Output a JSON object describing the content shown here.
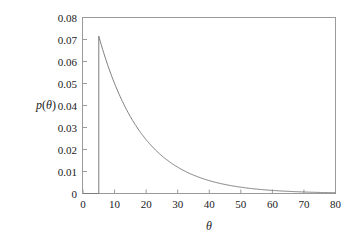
{
  "chart_data": {
    "type": "line",
    "title": "",
    "subtitle": "",
    "xlabel": "θ",
    "ylabel": "p(θ)",
    "xlim": [
      0,
      80
    ],
    "ylim": [
      0,
      0.08
    ],
    "grid": false,
    "legend": null,
    "x_ticks": [
      0,
      10,
      20,
      30,
      40,
      50,
      60,
      70,
      80
    ],
    "x_tick_labels": [
      "0",
      "10",
      "20",
      "30",
      "40",
      "50",
      "60",
      "70",
      "80"
    ],
    "x_minor_ticks": [
      5,
      15,
      25,
      35,
      45,
      55,
      65,
      75
    ],
    "y_ticks": [
      0,
      0.01,
      0.02,
      0.03,
      0.04,
      0.05,
      0.06,
      0.07,
      0.08
    ],
    "y_tick_labels": [
      "0",
      "0.01",
      "0.02",
      "0.03",
      "0.04",
      "0.05",
      "0.06",
      "0.07",
      "0.08"
    ],
    "threshold": 5,
    "peak_value": 0.0715,
    "decay_rate": 0.0715,
    "series": [
      {
        "name": "p(theta)",
        "color": "#7d7d7d",
        "x": [
          0,
          1,
          2,
          3,
          4,
          5,
          5,
          6,
          7,
          8,
          9,
          10,
          11,
          12,
          13,
          14,
          15,
          16,
          17,
          18,
          19,
          20,
          22,
          24,
          26,
          28,
          30,
          32,
          34,
          36,
          38,
          40,
          42,
          44,
          46,
          48,
          50,
          52,
          54,
          56,
          58,
          60,
          62,
          64,
          66,
          68,
          70,
          72,
          74,
          76,
          78,
          80
        ],
        "y": [
          0,
          0,
          0,
          0,
          0,
          0,
          0.0715,
          0.0666,
          0.062,
          0.0577,
          0.0538,
          0.0501,
          0.0466,
          0.0434,
          0.0404,
          0.0376,
          0.035,
          0.0326,
          0.0304,
          0.0283,
          0.0263,
          0.0245,
          0.0213,
          0.0184,
          0.016,
          0.0139,
          0.012,
          0.0104,
          0.0091,
          0.0079,
          0.0068,
          0.0059,
          0.0051,
          0.0045,
          0.0039,
          0.0034,
          0.0029,
          0.0025,
          0.0022,
          0.0019,
          0.0017,
          0.0014,
          0.0012,
          0.0011,
          0.0009,
          0.0008,
          0.0007,
          0.0006,
          0.0005,
          0.0005,
          0.0004,
          0.0003
        ]
      }
    ]
  },
  "figure": {
    "background_color": "#ffffff",
    "frame_color": "#9a9a9a",
    "text_color": "#1a1a1a"
  }
}
